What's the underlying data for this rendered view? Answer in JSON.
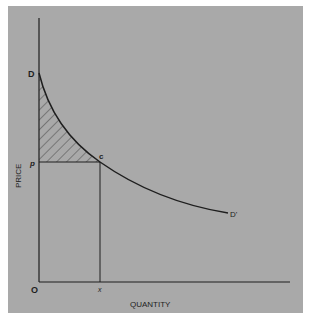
{
  "diagram": {
    "type": "demand-curve-consumer-surplus",
    "y_axis_label": "PRICE",
    "x_axis_label": "QUANTITY",
    "origin_label": "O",
    "points": {
      "curve_start": "D",
      "curve_end": "D'",
      "intersection": "c",
      "price_level": "p",
      "quantity_level": "x"
    },
    "shaded_region": "consumer surplus between D, p and c (hatched)",
    "colors": {
      "background": "#a9a9a9",
      "lines": "#1e1e1e"
    }
  }
}
